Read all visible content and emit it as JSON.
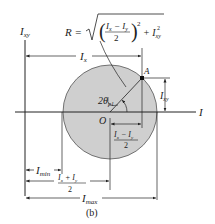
{
  "figure": {
    "caption": "(b)",
    "colors": {
      "circle_fill": "#cfcfcf",
      "line": "#222222"
    }
  },
  "labels": {
    "vertical_axis": "I",
    "vertical_axis_sub": "xy",
    "horizontal_axis": "I",
    "origin": "O",
    "point": "A",
    "radius_lhs": "R =",
    "radius_num": "I",
    "radius_num_sub1": "x",
    "radius_minus": " − ",
    "radius_num2": "I",
    "radius_num_sub2": "y",
    "radius_den": "2",
    "radius_exp": "2",
    "radius_plus": "+ I",
    "radius_term_sub": "xy",
    "radius_term_exp": "2",
    "ix": "I",
    "ix_sub": "x",
    "ixy": "I",
    "ixy_sub": "xy",
    "angle": "2θ",
    "angle_sub": "p1",
    "half_diff_num": "I",
    "half_diff_sub1": "x",
    "half_diff_minus": " − I",
    "half_diff_sub2": "y",
    "half_diff_den": "2",
    "imin": "I",
    "imin_sub": "min",
    "half_sum_num": "I",
    "half_sum_sub1": "x",
    "half_sum_plus": " + I",
    "half_sum_sub2": "y",
    "half_sum_den": "2",
    "imax": "I",
    "imax_sub": "max"
  }
}
